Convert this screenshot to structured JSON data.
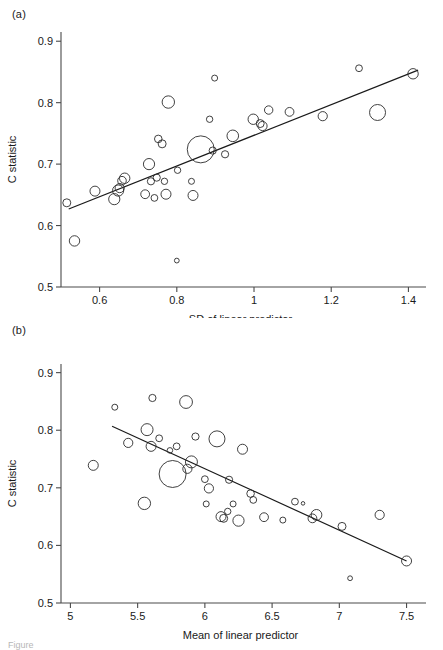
{
  "figure": {
    "caption_fragment": "Figure",
    "panel_a_tag": "(a)",
    "panel_b_tag": "(b)"
  },
  "chart_data": [
    {
      "id": "panel-a",
      "type": "scatter",
      "title": "",
      "panel_label": "(a)",
      "xlabel": "SD of linear predictor",
      "ylabel": "C statistic",
      "xlim": [
        0.5,
        1.43
      ],
      "ylim": [
        0.5,
        0.915
      ],
      "xticks": [
        0.6,
        0.8,
        1,
        1.2,
        1.4
      ],
      "xtick_labels": [
        "0.6",
        "0.8",
        "1",
        "1.2",
        "1.4"
      ],
      "yticks": [
        0.5,
        0.6,
        0.7,
        0.8,
        0.9
      ],
      "ytick_labels": [
        "0.5",
        "0.6",
        "0.7",
        "0.8",
        "0.9"
      ],
      "grid": false,
      "legend": "none",
      "marker": "open-circle",
      "size_encoding": "bubble area proportional to study weight",
      "fit_line": {
        "x0": 0.52,
        "y0": 0.627,
        "x1": 1.425,
        "y1": 0.853
      },
      "points": [
        {
          "x": 0.515,
          "y": 0.637,
          "r": 4.0
        },
        {
          "x": 0.535,
          "y": 0.575,
          "r": 5.2
        },
        {
          "x": 0.588,
          "y": 0.656,
          "r": 5.0
        },
        {
          "x": 0.638,
          "y": 0.643,
          "r": 5.6
        },
        {
          "x": 0.648,
          "y": 0.657,
          "r": 5.6
        },
        {
          "x": 0.652,
          "y": 0.661,
          "r": 4.6
        },
        {
          "x": 0.658,
          "y": 0.673,
          "r": 4.3
        },
        {
          "x": 0.665,
          "y": 0.677,
          "r": 5.2
        },
        {
          "x": 0.718,
          "y": 0.651,
          "r": 4.4
        },
        {
          "x": 0.728,
          "y": 0.7,
          "r": 5.6
        },
        {
          "x": 0.733,
          "y": 0.672,
          "r": 3.6
        },
        {
          "x": 0.742,
          "y": 0.645,
          "r": 3.4
        },
        {
          "x": 0.748,
          "y": 0.678,
          "r": 3.6
        },
        {
          "x": 0.752,
          "y": 0.741,
          "r": 3.8
        },
        {
          "x": 0.762,
          "y": 0.733,
          "r": 4.0
        },
        {
          "x": 0.768,
          "y": 0.672,
          "r": 3.2
        },
        {
          "x": 0.772,
          "y": 0.651,
          "r": 5.0
        },
        {
          "x": 0.778,
          "y": 0.801,
          "r": 6.2
        },
        {
          "x": 0.8,
          "y": 0.543,
          "r": 2.4
        },
        {
          "x": 0.802,
          "y": 0.69,
          "r": 3.2
        },
        {
          "x": 0.838,
          "y": 0.672,
          "r": 3.0
        },
        {
          "x": 0.842,
          "y": 0.649,
          "r": 5.0
        },
        {
          "x": 0.862,
          "y": 0.724,
          "r": 13.5
        },
        {
          "x": 0.885,
          "y": 0.773,
          "r": 3.2
        },
        {
          "x": 0.893,
          "y": 0.722,
          "r": 3.6
        },
        {
          "x": 0.898,
          "y": 0.84,
          "r": 3.0
        },
        {
          "x": 0.925,
          "y": 0.716,
          "r": 3.6
        },
        {
          "x": 0.945,
          "y": 0.746,
          "r": 5.8
        },
        {
          "x": 0.998,
          "y": 0.773,
          "r": 5.2
        },
        {
          "x": 1.016,
          "y": 0.766,
          "r": 4.0
        },
        {
          "x": 1.022,
          "y": 0.762,
          "r": 4.6
        },
        {
          "x": 1.038,
          "y": 0.788,
          "r": 4.2
        },
        {
          "x": 1.092,
          "y": 0.785,
          "r": 4.4
        },
        {
          "x": 1.178,
          "y": 0.778,
          "r": 4.6
        },
        {
          "x": 1.272,
          "y": 0.856,
          "r": 3.4
        },
        {
          "x": 1.32,
          "y": 0.784,
          "r": 8.0
        },
        {
          "x": 1.412,
          "y": 0.847,
          "r": 5.2
        }
      ]
    },
    {
      "id": "panel-b",
      "type": "scatter",
      "title": "",
      "panel_label": "(b)",
      "xlabel": "Mean of linear predictor",
      "ylabel": "C statistic",
      "xlim": [
        4.93,
        7.6
      ],
      "ylim": [
        0.5,
        0.915
      ],
      "xticks": [
        5,
        5.5,
        6,
        6.5,
        7,
        7.5
      ],
      "xtick_labels": [
        "5",
        "5.5",
        "6",
        "6.5",
        "7",
        "7.5"
      ],
      "yticks": [
        0.5,
        0.6,
        0.7,
        0.8,
        0.9
      ],
      "ytick_labels": [
        "0.5",
        "0.6",
        "0.7",
        "0.8",
        "0.9"
      ],
      "grid": false,
      "legend": "none",
      "marker": "open-circle",
      "size_encoding": "bubble area proportional to study weight",
      "fit_line": {
        "x0": 5.31,
        "y0": 0.807,
        "x1": 7.5,
        "y1": 0.573
      },
      "points": [
        {
          "x": 5.17,
          "y": 0.739,
          "r": 5.0
        },
        {
          "x": 5.33,
          "y": 0.84,
          "r": 3.0
        },
        {
          "x": 5.43,
          "y": 0.778,
          "r": 4.6
        },
        {
          "x": 5.55,
          "y": 0.673,
          "r": 6.2
        },
        {
          "x": 5.57,
          "y": 0.801,
          "r": 6.0
        },
        {
          "x": 5.6,
          "y": 0.772,
          "r": 5.0
        },
        {
          "x": 5.61,
          "y": 0.856,
          "r": 3.6
        },
        {
          "x": 5.66,
          "y": 0.786,
          "r": 3.4
        },
        {
          "x": 5.74,
          "y": 0.765,
          "r": 2.8
        },
        {
          "x": 5.76,
          "y": 0.724,
          "r": 13.5
        },
        {
          "x": 5.79,
          "y": 0.772,
          "r": 3.4
        },
        {
          "x": 5.86,
          "y": 0.849,
          "r": 6.4
        },
        {
          "x": 5.87,
          "y": 0.733,
          "r": 4.6
        },
        {
          "x": 5.9,
          "y": 0.745,
          "r": 6.0
        },
        {
          "x": 5.93,
          "y": 0.789,
          "r": 3.6
        },
        {
          "x": 6.0,
          "y": 0.715,
          "r": 3.4
        },
        {
          "x": 6.01,
          "y": 0.672,
          "r": 3.0
        },
        {
          "x": 6.03,
          "y": 0.699,
          "r": 4.6
        },
        {
          "x": 6.09,
          "y": 0.785,
          "r": 8.0
        },
        {
          "x": 6.12,
          "y": 0.65,
          "r": 5.0
        },
        {
          "x": 6.14,
          "y": 0.647,
          "r": 4.0
        },
        {
          "x": 6.17,
          "y": 0.659,
          "r": 3.2
        },
        {
          "x": 6.18,
          "y": 0.714,
          "r": 3.6
        },
        {
          "x": 6.21,
          "y": 0.672,
          "r": 3.0
        },
        {
          "x": 6.25,
          "y": 0.643,
          "r": 5.6
        },
        {
          "x": 6.28,
          "y": 0.767,
          "r": 5.0
        },
        {
          "x": 6.34,
          "y": 0.69,
          "r": 3.8
        },
        {
          "x": 6.36,
          "y": 0.679,
          "r": 3.4
        },
        {
          "x": 6.44,
          "y": 0.649,
          "r": 4.4
        },
        {
          "x": 6.58,
          "y": 0.644,
          "r": 3.0
        },
        {
          "x": 6.67,
          "y": 0.676,
          "r": 3.4
        },
        {
          "x": 6.73,
          "y": 0.673,
          "r": 1.8
        },
        {
          "x": 6.8,
          "y": 0.647,
          "r": 4.4
        },
        {
          "x": 6.83,
          "y": 0.653,
          "r": 5.4
        },
        {
          "x": 7.02,
          "y": 0.633,
          "r": 4.0
        },
        {
          "x": 7.08,
          "y": 0.543,
          "r": 2.4
        },
        {
          "x": 7.3,
          "y": 0.653,
          "r": 4.6
        },
        {
          "x": 7.5,
          "y": 0.573,
          "r": 5.0
        }
      ]
    }
  ]
}
